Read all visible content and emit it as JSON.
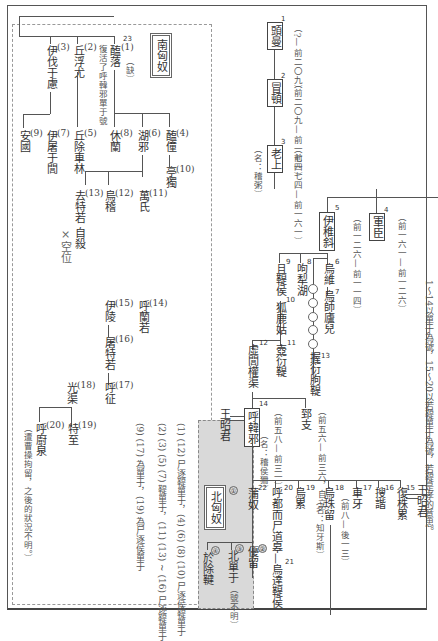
{
  "diagram": {
    "type": "genealogy",
    "outer_frame": true,
    "southern_xiongnu": {
      "title": "南匈奴",
      "members": [
        {
          "id": "1",
          "seq": "23",
          "name": "醢落",
          "note": "（缺）",
          "extra": "復活了呼韓邪單于號"
        },
        {
          "id": "2",
          "name": "丘浮尤"
        },
        {
          "id": "3",
          "name": "伊伐于慮"
        },
        {
          "id": "4",
          "name": "醢僮"
        },
        {
          "id": "5",
          "name": "丘除車林"
        },
        {
          "id": "6",
          "name": "湖邪"
        },
        {
          "id": "7",
          "name": "伊屠于閭"
        },
        {
          "id": "8",
          "name": "休蘭"
        },
        {
          "id": "9",
          "name": "安國"
        },
        {
          "id": "10",
          "name": "亭獨"
        },
        {
          "id": "11",
          "name": "萬氏"
        },
        {
          "id": "12",
          "name": "烏稽"
        },
        {
          "id": "13",
          "name": "去特若",
          "note": "自殺"
        },
        {
          "id": "14",
          "name": "呼蘭若"
        },
        {
          "id": "15",
          "name": "伊陵"
        },
        {
          "id": "16",
          "name": "屠特若"
        },
        {
          "id": "17",
          "name": "呼征"
        },
        {
          "id": "18",
          "name": "光渠"
        },
        {
          "id": "19",
          "name": "特至"
        },
        {
          "id": "20",
          "name": "呼廚泉",
          "note": "（遭曹操拘留，之後的狀況不明。）"
        }
      ],
      "vacancy": "×空位",
      "legend": [
        "(1) (12) 尸逐鞮單于，(4) (6) (8) (10) 尸逐侯鞮單于",
        "(2) (3) (5) (7) 鞮單于，(11) (13) ~ (16) 尸逐鞮單于",
        "(9) (17) 為單于，(19) 為尸逐侯單于"
      ]
    },
    "main_line": [
      {
        "seq": "1",
        "name": "頭曼",
        "dates": "（?— 前二〇九）"
      },
      {
        "seq": "2",
        "name": "冒頓",
        "dates": "（前二〇九— 前一七四）"
      },
      {
        "seq": "3",
        "name": "老上",
        "dates": "（前一七四— 前一六一）",
        "alias": "（名：稽粥）"
      },
      {
        "seq": "4",
        "name": "軍臣",
        "dates": "（前一六一— 前一二六）"
      },
      {
        "seq": "5",
        "name": "伊稚斜",
        "dates": "（前一二六— 前一一四）"
      },
      {
        "seq": "6",
        "name": "烏維"
      },
      {
        "seq": "7",
        "name": "烏師廬兒"
      },
      {
        "seq": "8",
        "name": "呴犁湖"
      },
      {
        "seq": "9",
        "name": "且鞮侯"
      },
      {
        "seq": "10",
        "name": "狐鹿姑"
      },
      {
        "seq": "11",
        "name": "壺衍鞮"
      },
      {
        "seq": "12",
        "name": "虛閭權渠"
      },
      {
        "seq": "13",
        "name": "握衍朐鞮"
      },
      {
        "seq": "14",
        "name": "呼韓邪",
        "dates": "（前五八— 前三一）",
        "alias": "（名：稽侯狦）",
        "spouse": "王昭君"
      },
      {
        "name": "郅支",
        "dates": "（前五六— 前三六，自立）"
      },
      {
        "seq": "15",
        "name": "復株累",
        "spouse": "王昭君"
      },
      {
        "seq": "16",
        "name": "搜諧"
      },
      {
        "seq": "17",
        "name": "車牙"
      },
      {
        "seq": "18",
        "name": "烏珠留",
        "dates": "（前八— 後一三）",
        "alias": "（名：知牙斯）"
      },
      {
        "seq": "19",
        "name": "烏累"
      },
      {
        "seq": "20",
        "name": "呼都而尸道皋"
      },
      {
        "seq": "21",
        "name": "烏達鞮侯"
      },
      {
        "seq": "22",
        "name": "蒲奴"
      }
    ],
    "northern_xiongnu": {
      "title": "北匈奴",
      "members": [
        {
          "id": "①",
          "name": "蒲奴"
        },
        {
          "id": "②",
          "name": "優留"
        },
        {
          "id": "③",
          "name": "北單于",
          "note": "（號不明）"
        },
        {
          "id": "④",
          "name": "於除鞬"
        }
      ]
    },
    "note": "1～14以單于為號，15～20以若鞮單于為號，若鞮是孝的意思。"
  }
}
